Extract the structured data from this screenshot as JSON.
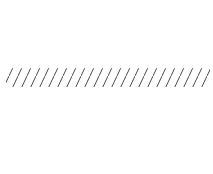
{
  "figure": {
    "axes": {
      "x_label": "x",
      "y_label": "y",
      "origin_label": "O"
    },
    "x_ticks": [
      {
        "value": -4,
        "label": "−4"
      },
      {
        "value": -2,
        "label": "−2"
      },
      {
        "value": 2,
        "label": "2"
      },
      {
        "value": 4,
        "label": "4"
      }
    ],
    "y_ticks": [
      {
        "value": 3,
        "label": "3"
      },
      {
        "value": 2,
        "label": "2"
      }
    ],
    "grid": {
      "x_min": -5,
      "x_max": 6,
      "y_min": -2,
      "y_max": 6
    },
    "region": {
      "description": "Shaded band between y = 2 (solid, included) and y = 3 (dashed, excluded)",
      "lower_boundary": {
        "y": 2,
        "style": "solid"
      },
      "upper_boundary": {
        "y": 3,
        "style": "dashed"
      },
      "inequality": "2 ≤ y < 3"
    }
  }
}
